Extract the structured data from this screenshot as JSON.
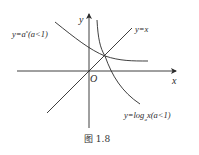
{
  "figure": {
    "caption": "图 1.8",
    "axes": {
      "x_label": "x",
      "y_label": "y",
      "origin_label": "O"
    },
    "curves": [
      {
        "id": "exponential",
        "label_prefix": "y=a",
        "label_sup": "x",
        "label_suffix": "(a<1)"
      },
      {
        "id": "identity",
        "label": "y=x"
      },
      {
        "id": "logarithm",
        "label_prefix": "y=log",
        "label_sub": "a",
        "label_suffix": "x(a<1)"
      }
    ],
    "colors": {
      "line": "#2a2a2a",
      "text": "#2a2a2a"
    }
  }
}
